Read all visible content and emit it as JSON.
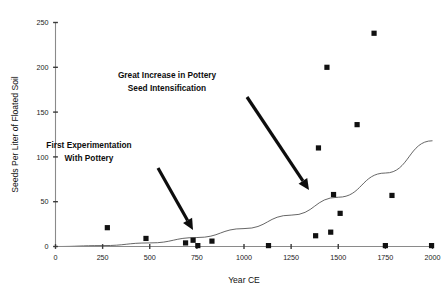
{
  "chart_data": {
    "type": "scatter",
    "title": "",
    "xlabel": "Year CE",
    "ylabel": "Seeds Per Liter of Floated Soil",
    "xlim": [
      0,
      2000
    ],
    "ylim": [
      0,
      250
    ],
    "xticks": [
      0,
      250,
      500,
      750,
      1000,
      1250,
      1500,
      1750,
      2000
    ],
    "yticks": [
      0,
      50,
      100,
      150,
      200,
      250
    ],
    "grid": false,
    "legend": "none",
    "series": [
      {
        "name": "Seed density samples",
        "marker": "filled-square",
        "color": "#111111",
        "points": [
          {
            "x": 275,
            "y": 21
          },
          {
            "x": 480,
            "y": 9
          },
          {
            "x": 690,
            "y": 4
          },
          {
            "x": 730,
            "y": 7
          },
          {
            "x": 755,
            "y": 1
          },
          {
            "x": 830,
            "y": 6
          },
          {
            "x": 1130,
            "y": 1
          },
          {
            "x": 1380,
            "y": 12
          },
          {
            "x": 1395,
            "y": 110
          },
          {
            "x": 1440,
            "y": 200
          },
          {
            "x": 1460,
            "y": 16
          },
          {
            "x": 1475,
            "y": 58
          },
          {
            "x": 1510,
            "y": 37
          },
          {
            "x": 1600,
            "y": 136
          },
          {
            "x": 1690,
            "y": 238
          },
          {
            "x": 1750,
            "y": 1
          },
          {
            "x": 1785,
            "y": 57
          },
          {
            "x": 1995,
            "y": 1
          }
        ]
      }
    ],
    "trend_line": {
      "name": "exponential-trend",
      "color": "#555555",
      "points": [
        {
          "x": 0,
          "y": 0
        },
        {
          "x": 250,
          "y": 1
        },
        {
          "x": 500,
          "y": 4
        },
        {
          "x": 750,
          "y": 10
        },
        {
          "x": 1000,
          "y": 20
        },
        {
          "x": 1250,
          "y": 35
        },
        {
          "x": 1500,
          "y": 55
        },
        {
          "x": 1750,
          "y": 82
        },
        {
          "x": 2000,
          "y": 118
        }
      ]
    },
    "annotations": [
      {
        "id": "annotation-great-increase",
        "lines": [
          "Great Increase in Pottery",
          "Seed Intensification"
        ],
        "text_anchor_x": 167,
        "text_anchor_y": 78,
        "arrow_from_x": 247,
        "arrow_from_y": 97,
        "arrow_to_x": 309,
        "arrow_to_y": 190
      },
      {
        "id": "annotation-first-experimentation",
        "lines": [
          "First Experimentation",
          "With Pottery"
        ],
        "text_anchor_x": 89,
        "text_anchor_y": 148,
        "arrow_from_x": 158,
        "arrow_from_y": 168,
        "arrow_to_x": 193,
        "arrow_to_y": 230
      }
    ]
  }
}
